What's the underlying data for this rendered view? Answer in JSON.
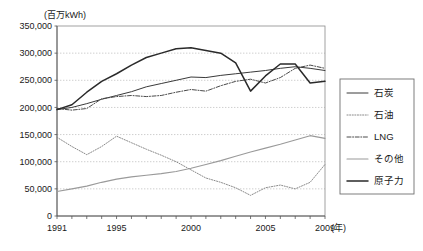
{
  "chart_data": {
    "type": "line",
    "title": "",
    "unit_label": "(百万kWh)",
    "xlabel": "(年)",
    "ylabel": "",
    "xlim": [
      1991,
      2009
    ],
    "ylim": [
      0,
      350000
    ],
    "ytick_step": 50000,
    "grid": true,
    "legend_position": "right",
    "ytick_labels": [
      "350,000",
      "300,000",
      "250,000",
      "200,000",
      "150,000",
      "100,000",
      "50,000",
      "0"
    ],
    "ytick_values": [
      350000,
      300000,
      250000,
      200000,
      150000,
      100000,
      50000,
      0
    ],
    "xtick_labels": [
      "1991",
      "1995",
      "2000",
      "2005",
      "2009"
    ],
    "xtick_values": [
      1991,
      1995,
      2000,
      2005,
      2009
    ],
    "x": [
      1991,
      1992,
      1993,
      1994,
      1995,
      1996,
      1997,
      1998,
      1999,
      2000,
      2001,
      2002,
      2003,
      2004,
      2005,
      2006,
      2007,
      2008,
      2009
    ],
    "series": [
      {
        "name": "石炭",
        "style": "solid-thin",
        "color": "#3a3a3a",
        "values": [
          196000,
          200000,
          207000,
          215000,
          222000,
          229000,
          238000,
          244000,
          250000,
          256000,
          255000,
          259000,
          262000,
          265000,
          268000,
          272000,
          275000,
          272000,
          268000
        ]
      },
      {
        "name": "石油",
        "style": "dotted",
        "color": "#8a8a8a",
        "values": [
          145000,
          128000,
          113000,
          128000,
          147000,
          135000,
          123000,
          112000,
          100000,
          85000,
          70000,
          62000,
          52000,
          38000,
          52000,
          57000,
          50000,
          62000,
          95000
        ]
      },
      {
        "name": "LNG",
        "style": "dash-dot",
        "color": "#4a4a4a",
        "values": [
          198000,
          195000,
          198000,
          216000,
          220000,
          222000,
          220000,
          222000,
          228000,
          233000,
          230000,
          240000,
          248000,
          252000,
          245000,
          255000,
          272000,
          278000,
          272000
        ]
      },
      {
        "name": "その他",
        "style": "solid-gray",
        "color": "#9a9a9a",
        "values": [
          45000,
          50000,
          55000,
          62000,
          68000,
          72000,
          75000,
          78000,
          82000,
          88000,
          95000,
          102000,
          110000,
          118000,
          125000,
          132000,
          140000,
          148000,
          143000
        ]
      },
      {
        "name": "原子力",
        "style": "solid-thick",
        "color": "#2a2a2a",
        "values": [
          196000,
          205000,
          228000,
          248000,
          262000,
          278000,
          292000,
          300000,
          308000,
          310000,
          305000,
          300000,
          282000,
          230000,
          258000,
          280000,
          280000,
          245000,
          248000
        ]
      }
    ]
  },
  "legend": {
    "items": [
      {
        "label": "石炭"
      },
      {
        "label": "石油"
      },
      {
        "label": "LNG"
      },
      {
        "label": "その他"
      },
      {
        "label": "原子力"
      }
    ]
  }
}
